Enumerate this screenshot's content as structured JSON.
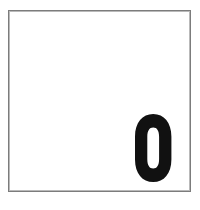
{
  "page": {
    "background_color": "#ffffff",
    "width": 200,
    "height": 210
  },
  "frame": {
    "name": "image-border",
    "border_color": "#7c7c7c",
    "inner_border_color": "#b9b9b9",
    "fill_color": "#ffffff",
    "left": 8,
    "top": 10,
    "width": 183,
    "height": 182
  },
  "content": {
    "character": "0",
    "character_name": "digit-zero",
    "color": "#111111",
    "style": "ultra-bold condensed sans-serif",
    "position": "bottom-right",
    "glyph_box": {
      "left": 132,
      "top": 108,
      "width": 40,
      "height": 78
    },
    "outer_rx": 18,
    "outer_ry": 33,
    "counter_rx": 6.5,
    "counter_ry": 20
  }
}
